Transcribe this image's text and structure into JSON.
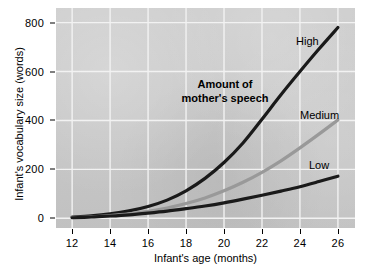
{
  "chart_data": {
    "type": "line",
    "title": "",
    "xlabel": "Infant's age (months)",
    "ylabel": "Infant's vocabulary size (words)",
    "xlim": [
      11.15,
      26.9
    ],
    "ylim": [
      -40,
      860
    ],
    "xticks": [
      12,
      14,
      16,
      18,
      20,
      22,
      24,
      26
    ],
    "yticks": [
      0,
      200,
      400,
      600,
      800
    ],
    "xtick_labels": [
      "12",
      "14",
      "16",
      "18",
      "20",
      "22",
      "24",
      "26"
    ],
    "ytick_labels": [
      "0",
      "200",
      "400",
      "600",
      "800"
    ],
    "grid": true,
    "grid_color": "#f2f2f2",
    "plot_background": "#c9c9c9",
    "legend_position": "inline-end-of-line",
    "annotations": [
      {
        "name": "amount-of-mothers-speech",
        "text": "Amount of\nmother's speech",
        "bold": true
      }
    ],
    "x": [
      12,
      13,
      14,
      15,
      16,
      17,
      18,
      19,
      20,
      21,
      22,
      23,
      24,
      25,
      26
    ],
    "series": [
      {
        "name": "High",
        "label": "High",
        "color": "#1a1a1a",
        "width": 3.2,
        "values": [
          5,
          10,
          18,
          30,
          48,
          74,
          112,
          163,
          228,
          308,
          405,
          505,
          600,
          692,
          780
        ]
      },
      {
        "name": "Medium",
        "label": "Medium",
        "color": "#999999",
        "width": 3.2,
        "values": [
          3,
          6,
          11,
          18,
          28,
          42,
          60,
          83,
          112,
          147,
          188,
          235,
          288,
          344,
          402
        ]
      },
      {
        "name": "Low",
        "label": "Low",
        "color": "#1a1a1a",
        "width": 3.2,
        "values": [
          2,
          5,
          9,
          14,
          21,
          29,
          39,
          50,
          63,
          78,
          94,
          111,
          129,
          150,
          172
        ]
      }
    ]
  },
  "axis": {
    "x_title": "Infant's age (months)",
    "y_title": "Infant's vocabulary size (words)"
  },
  "labels": {
    "high": "High",
    "medium": "Medium",
    "low": "Low",
    "annotation_line1": "Amount of",
    "annotation_line2": "mother's speech"
  }
}
